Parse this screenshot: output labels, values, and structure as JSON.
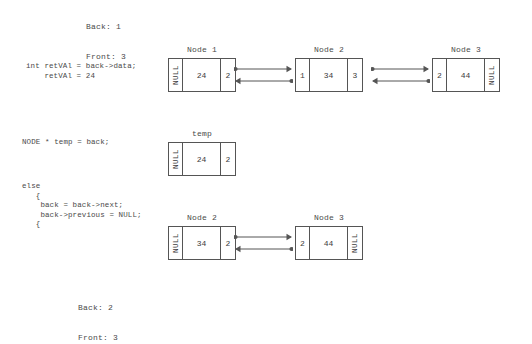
{
  "status_top": {
    "back_label": "Back: 1",
    "front_label": "Front: 3"
  },
  "status_bottom": {
    "back_label": "Back: 2",
    "front_label": "Front: 3"
  },
  "code_blocks": {
    "retval": "int retVAl = back->data;\n    retVAl = 24",
    "temp": "NODE * temp = back;",
    "else": "else\n   {\n    back = back->next;\n    back->previous = NULL;\n   {"
  },
  "rows": [
    {
      "id": "row-1",
      "nodes": [
        {
          "label": "Node 1",
          "left": 168,
          "cells": [
            {
              "kind": "null",
              "text": "NULL"
            },
            {
              "kind": "data",
              "text": "24"
            },
            {
              "kind": "ptr",
              "text": "2"
            }
          ]
        },
        {
          "label": "Node 2",
          "left": 295,
          "cells": [
            {
              "kind": "ptr",
              "text": "1"
            },
            {
              "kind": "data",
              "text": "34"
            },
            {
              "kind": "ptr",
              "text": "3"
            }
          ]
        },
        {
          "label": "Node 3",
          "left": 432,
          "cells": [
            {
              "kind": "ptr",
              "text": "2"
            },
            {
              "kind": "data",
              "text": "44"
            },
            {
              "kind": "null",
              "text": "NULL"
            }
          ]
        }
      ],
      "links": [
        {
          "left": 234,
          "width": 59
        },
        {
          "left": 371,
          "width": 59
        }
      ]
    },
    {
      "id": "row-2",
      "nodes": [
        {
          "label": "temp",
          "left": 168,
          "cells": [
            {
              "kind": "null",
              "text": "NULL"
            },
            {
              "kind": "data",
              "text": "24"
            },
            {
              "kind": "ptr",
              "text": "2"
            }
          ]
        }
      ],
      "links": []
    },
    {
      "id": "row-3",
      "nodes": [
        {
          "label": "Node 2",
          "left": 168,
          "cells": [
            {
              "kind": "null",
              "text": "NULL"
            },
            {
              "kind": "data",
              "text": "34"
            },
            {
              "kind": "ptr",
              "text": "2"
            }
          ]
        },
        {
          "label": "Node 3",
          "left": 295,
          "cells": [
            {
              "kind": "ptr",
              "text": "2"
            },
            {
              "kind": "data",
              "text": "44"
            },
            {
              "kind": "null",
              "text": "NULL"
            }
          ]
        }
      ],
      "links": [
        {
          "left": 234,
          "width": 59
        }
      ]
    }
  ],
  "colors": {
    "background": "#ffffff",
    "stroke": "#555555",
    "text": "#4a4a4a"
  }
}
